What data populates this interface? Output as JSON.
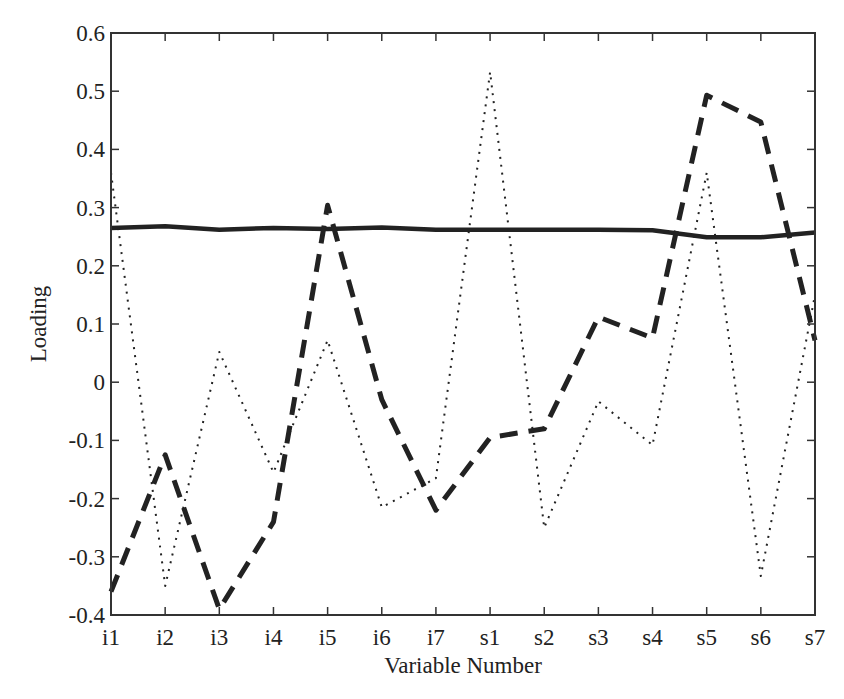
{
  "chart_data": {
    "type": "line",
    "title": "",
    "xlabel": "Variable Number",
    "ylabel": "Loading",
    "categories": [
      "i1",
      "i2",
      "i3",
      "i4",
      "i5",
      "i6",
      "i7",
      "s1",
      "s2",
      "s3",
      "s4",
      "s5",
      "s6",
      "s7"
    ],
    "ylim": [
      -0.4,
      0.6
    ],
    "yticks": [
      -0.4,
      -0.3,
      -0.2,
      -0.1,
      0,
      0.1,
      0.2,
      0.3,
      0.4,
      0.5,
      0.6
    ],
    "ytick_labels": [
      "-0.4",
      "-0.3",
      "-0.2",
      "-0.1",
      "0",
      "0.1",
      "0.2",
      "0.3",
      "0.4",
      "0.5",
      "0.6"
    ],
    "grid": false,
    "legend": null,
    "series": [
      {
        "name": "solid",
        "style": "solid",
        "values": [
          0.265,
          0.268,
          0.262,
          0.265,
          0.263,
          0.266,
          0.262,
          0.262,
          0.262,
          0.262,
          0.261,
          0.249,
          0.249,
          0.257
        ]
      },
      {
        "name": "dashed",
        "style": "dashed",
        "values": [
          -0.36,
          -0.125,
          -0.39,
          -0.24,
          0.304,
          -0.03,
          -0.22,
          -0.095,
          -0.08,
          0.112,
          0.076,
          0.493,
          0.447,
          0.072
        ]
      },
      {
        "name": "dotted",
        "style": "dotted",
        "values": [
          0.36,
          -0.35,
          0.052,
          -0.155,
          0.072,
          -0.215,
          -0.165,
          0.533,
          -0.25,
          -0.033,
          -0.108,
          0.36,
          -0.333,
          0.15
        ]
      }
    ]
  },
  "colors": {
    "line": "#222222",
    "axis": "#333333",
    "background": "#ffffff"
  }
}
